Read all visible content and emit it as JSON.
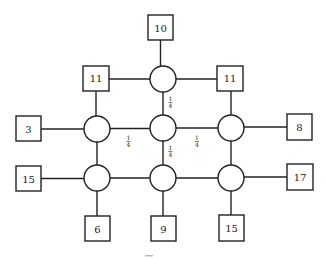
{
  "diagram": {
    "type": "grid network of circle nodes connected to square terminal boxes",
    "colors": {
      "stroke": "#222222",
      "background": "#ffffff"
    },
    "circles": [
      {
        "id": "c-top",
        "cx": 163,
        "cy": 79,
        "r": 13
      },
      {
        "id": "c-mid-left",
        "cx": 97,
        "cy": 129,
        "r": 13
      },
      {
        "id": "c-mid-center",
        "cx": 163,
        "cy": 128,
        "r": 13
      },
      {
        "id": "c-mid-right",
        "cx": 231,
        "cy": 128,
        "r": 13
      },
      {
        "id": "c-bot-left",
        "cx": 97,
        "cy": 178,
        "r": 13
      },
      {
        "id": "c-bot-center",
        "cx": 163,
        "cy": 178,
        "r": 13
      },
      {
        "id": "c-bot-right",
        "cx": 231,
        "cy": 178,
        "r": 13
      }
    ],
    "boxes": [
      {
        "id": "b-top",
        "label": "10",
        "x": 148,
        "y": 15,
        "w": 25,
        "h": 25
      },
      {
        "id": "b-upper-left",
        "label": "11",
        "x": 83,
        "y": 65,
        "w": 26,
        "h": 26
      },
      {
        "id": "b-upper-right",
        "label": "11",
        "x": 217,
        "y": 65,
        "w": 26,
        "h": 26
      },
      {
        "id": "b-left-mid",
        "label": "3",
        "x": 16,
        "y": 116,
        "w": 25,
        "h": 25
      },
      {
        "id": "b-right-mid",
        "label": "8",
        "x": 287,
        "y": 114,
        "w": 25,
        "h": 26
      },
      {
        "id": "b-left-bot",
        "label": "15",
        "x": 16,
        "y": 166,
        "w": 25,
        "h": 25
      },
      {
        "id": "b-right-bot",
        "label": "17",
        "x": 287,
        "y": 164,
        "w": 26,
        "h": 26
      },
      {
        "id": "b-bottom-left",
        "label": "6",
        "x": 85,
        "y": 216,
        "w": 25,
        "h": 25
      },
      {
        "id": "b-bottom-center",
        "label": "9",
        "x": 151,
        "y": 216,
        "w": 25,
        "h": 25
      },
      {
        "id": "b-bottom-right",
        "label": "15",
        "x": 219,
        "y": 215,
        "w": 25,
        "h": 26
      }
    ],
    "edge_labels": [
      {
        "id": "w-top-center",
        "text": "1/4",
        "num": "1",
        "den": "4",
        "x": 170,
        "y": 103
      },
      {
        "id": "w-left-center",
        "text": "1/4",
        "num": "1",
        "den": "4",
        "x": 128,
        "y": 143
      },
      {
        "id": "w-center-right",
        "text": "1/4",
        "num": "1",
        "den": "4",
        "x": 197,
        "y": 143
      },
      {
        "id": "w-center-bottom",
        "text": "1/4",
        "num": "1",
        "den": "4",
        "x": 170,
        "y": 152
      }
    ],
    "box_labels": {
      "top": "10",
      "upper_left": "11",
      "upper_right": "11",
      "left_mid": "3",
      "right_mid": "8",
      "left_bot": "15",
      "right_bot": "17",
      "bottom_left": "6",
      "bottom_center": "9",
      "bottom_right": "15"
    },
    "fraction": {
      "num": "1",
      "den": "4"
    }
  }
}
